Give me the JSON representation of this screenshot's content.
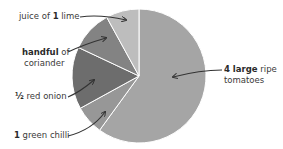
{
  "chart_data": {
    "type": "pie",
    "title": "",
    "start_angle_deg": 0,
    "direction": "clockwise",
    "slices": [
      {
        "label": "4 large ripe tomatoes",
        "bold": "4 large",
        "rest": " ripe",
        "line2": "tomatoes",
        "value": 60,
        "color": "#a5a5a5"
      },
      {
        "label": "1 green chilli",
        "bold": "1",
        "rest": " green chilli",
        "value": 7,
        "color": "#979797"
      },
      {
        "label": "½ red onion",
        "bold": "½",
        "rest": " red onion",
        "value": 15,
        "color": "#6d6d6d"
      },
      {
        "label": "handful of coriander",
        "bold": "handful",
        "rest": " of",
        "line2": "coriander",
        "value": 10,
        "color": "#838383"
      },
      {
        "label": "juice of 1 lime",
        "pre": "juice of ",
        "bold": "1",
        "rest": " lime",
        "value": 8,
        "color": "#bdbdbd"
      }
    ],
    "legend": "none",
    "annotations": "arrow labels"
  },
  "labels": {
    "tomatoes": {
      "bold": "4 large",
      "rest": " ripe",
      "line2": "tomatoes"
    },
    "chilli": {
      "bold": "1",
      "rest": " green chilli"
    },
    "onion": {
      "bold": "½",
      "rest": " red onion"
    },
    "coriander": {
      "bold": "handful",
      "rest": " of",
      "line2": "coriander"
    },
    "lime": {
      "pre": "juice of ",
      "bold": "1",
      "rest": " lime"
    }
  }
}
